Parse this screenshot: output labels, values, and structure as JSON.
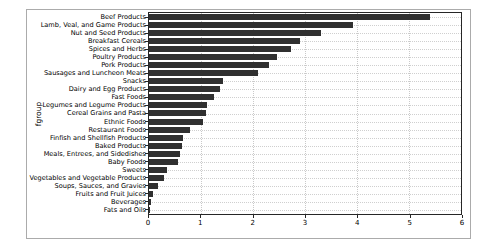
{
  "figure": {
    "background": "#ffffff",
    "border_color": "#ababab"
  },
  "chart_data": {
    "type": "bar",
    "orientation": "horizontal",
    "title": "",
    "xlabel": "",
    "ylabel": "fgroup",
    "xlim": [
      0,
      6
    ],
    "x_ticks": [
      0,
      1,
      2,
      3,
      4,
      5,
      6
    ],
    "grid": true,
    "legend": "none",
    "bar_color": "#303030",
    "axis_color": "#262626",
    "gridline_color": "#c9c9c9",
    "categories": [
      "Beef Products",
      "Lamb, Veal, and Game Products",
      "Nut and Seed Products",
      "Breakfast Cereals",
      "Spices and Herbs",
      "Poultry Products",
      "Pork Products",
      "Sausages and Luncheon Meats",
      "Snacks",
      "Dairy and Egg Products",
      "Fast Foods",
      "Legumes and Legume Products",
      "Cereal Grains and Pasta",
      "Ethnic Foods",
      "Restaurant Foods",
      "Finfish and Shellfish Products",
      "Baked Products",
      "Meals, Entrees, and Sidedishes",
      "Baby Foods",
      "Sweets",
      "Vegetables and Vegetable Products",
      "Soups, Sauces, and Gravies",
      "Fruits and Fruit Juices",
      "Beverages",
      "Fats and Oils"
    ],
    "values": [
      5.4,
      3.93,
      3.3,
      2.9,
      2.73,
      2.47,
      2.3,
      2.1,
      1.43,
      1.37,
      1.25,
      1.12,
      1.1,
      1.03,
      0.78,
      0.65,
      0.63,
      0.59,
      0.56,
      0.34,
      0.29,
      0.17,
      0.07,
      0.03,
      0.01
    ]
  }
}
